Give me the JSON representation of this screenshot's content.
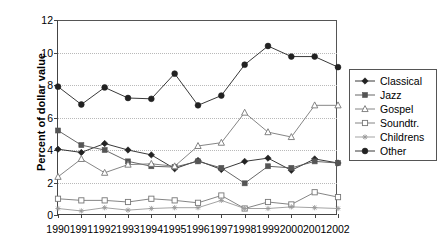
{
  "chart_data": {
    "type": "line",
    "title": "",
    "xlabel": "",
    "ylabel": "Percent of dollar value",
    "ylim": [
      0,
      12
    ],
    "yticks": [
      0,
      2,
      4,
      6,
      8,
      10,
      12
    ],
    "grid": true,
    "legend_position": "right",
    "categories": [
      "1990",
      "1991",
      "1992",
      "1993",
      "1994",
      "1995",
      "1996",
      "1997",
      "1998",
      "1999",
      "2000",
      "2001",
      "2002"
    ],
    "series": [
      {
        "name": "Classical",
        "marker": "filled-diamond",
        "color": "#222222",
        "values": [
          4.05,
          3.85,
          4.4,
          4.0,
          3.7,
          2.85,
          3.35,
          2.8,
          3.3,
          3.5,
          2.75,
          3.45,
          3.2
        ]
      },
      {
        "name": "Jazz",
        "marker": "filled-square",
        "color": "#555555",
        "values": [
          5.2,
          4.3,
          4.0,
          3.3,
          3.0,
          2.95,
          3.3,
          2.9,
          1.95,
          3.0,
          2.9,
          3.3,
          3.2
        ]
      },
      {
        "name": "Gospel",
        "marker": "open-triangle",
        "color": "#777777",
        "values": [
          2.35,
          3.45,
          2.6,
          3.1,
          3.15,
          3.0,
          4.25,
          4.45,
          6.3,
          5.1,
          4.8,
          6.75,
          6.75
        ]
      },
      {
        "name": "Soundtr.",
        "marker": "open-square",
        "color": "#777777",
        "values": [
          1.0,
          0.9,
          0.9,
          0.8,
          1.0,
          0.9,
          0.75,
          1.2,
          0.4,
          0.8,
          0.65,
          1.4,
          1.1
        ]
      },
      {
        "name": "Childrens",
        "marker": "star",
        "color": "#999999",
        "values": [
          0.4,
          0.25,
          0.45,
          0.3,
          0.4,
          0.45,
          0.45,
          0.9,
          0.4,
          0.4,
          0.5,
          0.45,
          0.4
        ]
      },
      {
        "name": "Other",
        "marker": "filled-circle",
        "color": "#222222",
        "values": [
          7.9,
          6.8,
          7.85,
          7.2,
          7.15,
          8.7,
          6.75,
          7.35,
          9.25,
          10.4,
          9.75,
          9.75,
          9.1
        ]
      }
    ]
  }
}
